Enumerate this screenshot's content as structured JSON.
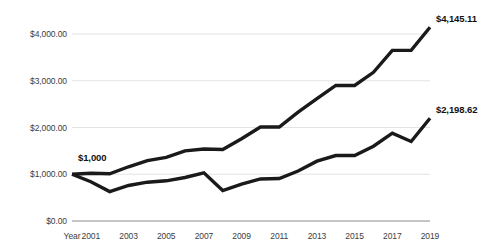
{
  "chart_data": {
    "type": "line",
    "title": "",
    "subtitle": "",
    "xlabel": "Year",
    "ylabel": "",
    "grid": true,
    "legend": "none",
    "ylim": [
      0,
      4500
    ],
    "y_ticks": [
      0,
      1000,
      2000,
      3000,
      4000
    ],
    "y_tick_labels": [
      "$0.00",
      "$1,000.00",
      "$2,000.00",
      "$3,000.00",
      "$4,000.00"
    ],
    "x": [
      2000,
      2001,
      2002,
      2003,
      2004,
      2005,
      2006,
      2007,
      2008,
      2009,
      2010,
      2011,
      2012,
      2013,
      2014,
      2015,
      2016,
      2017,
      2018,
      2019
    ],
    "x_tick_labels": [
      "Year",
      "2001",
      "2003",
      "2005",
      "2007",
      "2009",
      "2011",
      "2013",
      "2015",
      "2017",
      "2019"
    ],
    "x_ticks_shown": [
      2000,
      2001,
      2003,
      2005,
      2007,
      2009,
      2011,
      2013,
      2015,
      2017,
      2019
    ],
    "series": [
      {
        "name": "upper",
        "values": [
          1000,
          1020,
          1010,
          1160,
          1290,
          1360,
          1500,
          1540,
          1530,
          1760,
          2010,
          2010,
          2330,
          2620,
          2900,
          2900,
          3180,
          3650,
          3650,
          4145.11
        ],
        "end_label": "$4,145.11",
        "color": "#1a1a1a"
      },
      {
        "name": "lower",
        "values": [
          1000,
          840,
          630,
          760,
          830,
          860,
          930,
          1030,
          650,
          790,
          900,
          910,
          1070,
          1280,
          1400,
          1400,
          1600,
          1880,
          1700,
          2198.62
        ],
        "end_label": "$2,198.62",
        "color": "#1a1a1a"
      }
    ],
    "annotations": [
      {
        "text": "$1,000",
        "at_x": 2000,
        "at_y": 1000,
        "position": "above-left"
      },
      {
        "text": "$4,145.11",
        "at_x": 2019,
        "at_y": 4145.11,
        "position": "right"
      },
      {
        "text": "$2,198.62",
        "at_x": 2019,
        "at_y": 2198.62,
        "position": "right"
      }
    ],
    "colors": {
      "line": "#1a1a1a",
      "grid": "#e3e3e3",
      "axis": "#8c8c8c",
      "text": "#3d3d3d",
      "label_text": "#111111",
      "background": "#ffffff"
    }
  },
  "axis": {
    "y_labels": [
      "$4,000.00",
      "$3,000.00",
      "$2,000.00",
      "$1,000.00",
      "$0.00"
    ],
    "x_labels": [
      "Year",
      "2001",
      "2003",
      "2005",
      "2007",
      "2009",
      "2011",
      "2013",
      "2015",
      "2017",
      "2019"
    ]
  },
  "labels": {
    "start": "$1,000",
    "upper_end": "$4,145.11",
    "lower_end": "$2,198.62"
  }
}
